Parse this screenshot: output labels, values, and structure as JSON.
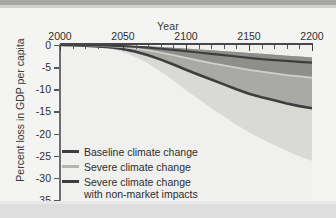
{
  "figure": {
    "title_x": "Year",
    "title_y": "Percent loss in GDP per capita"
  },
  "axes": {
    "x_ticks_major": [
      "2000",
      "2050",
      "2100",
      "2150",
      "2200"
    ],
    "y_ticks": [
      "0",
      "-5",
      "-10",
      "-15",
      "-20",
      "-25",
      "-30",
      "-35"
    ]
  },
  "legend": {
    "items": [
      {
        "label": "Baseline climate change",
        "color": "#3c3e40"
      },
      {
        "label": "Severe climate change",
        "color": "#b4b4b2"
      },
      {
        "label": "Severe climate change",
        "color": "#3c3e40"
      }
    ],
    "continuation": "with non-market impacts"
  },
  "colors": {
    "plot_background": "#f0f0ee",
    "page_background": "#f3f3f1",
    "band_outer_light": "#d9d9d6",
    "band_mid_gray": "#a9a9a6",
    "band_inner_dark": "#8e8e8b",
    "line_dark": "#3c3e40",
    "line_light": "#cfcfcb",
    "axis": "#45474a",
    "text": "#2f2f2f"
  },
  "chart_data": {
    "type": "area",
    "title": "",
    "xlabel": "Year",
    "ylabel": "Percent loss in GDP per capita",
    "xlim": [
      2000,
      2200
    ],
    "ylim": [
      -35,
      0
    ],
    "x_tick_step_minor": 10,
    "x_tick_step_major": 50,
    "y_tick_step": 5,
    "grid": false,
    "legend_position": "lower-left inside plot",
    "x": [
      2000,
      2010,
      2020,
      2030,
      2040,
      2050,
      2060,
      2070,
      2080,
      2090,
      2100,
      2110,
      2120,
      2130,
      2140,
      2150,
      2160,
      2170,
      2180,
      2190,
      2200
    ],
    "series": [
      {
        "name": "Baseline climate change",
        "role": "mean-line",
        "color": "#3c3e40",
        "values": [
          0,
          0,
          -0.05,
          -0.1,
          -0.15,
          -0.25,
          -0.4,
          -0.6,
          -0.85,
          -1.1,
          -1.4,
          -1.7,
          -2.0,
          -2.3,
          -2.6,
          -2.9,
          -3.2,
          -3.4,
          -3.6,
          -3.8,
          -4.0
        ]
      },
      {
        "name": "Baseline climate change (5th-95th percentile band)",
        "role": "band",
        "color": "#a9a9a6",
        "lower": [
          0,
          -0.05,
          -0.1,
          -0.2,
          -0.3,
          -0.45,
          -0.7,
          -1.0,
          -1.4,
          -1.9,
          -2.4,
          -2.9,
          -3.4,
          -3.9,
          -4.4,
          -4.9,
          -5.2,
          -5.5,
          -5.8,
          -6.0,
          -6.2
        ],
        "upper": [
          0,
          0,
          0,
          -0.05,
          -0.1,
          -0.15,
          -0.2,
          -0.3,
          -0.45,
          -0.6,
          -0.8,
          -1.0,
          -1.2,
          -1.4,
          -1.6,
          -1.8,
          -2.0,
          -2.2,
          -2.4,
          -2.6,
          -2.8
        ]
      },
      {
        "name": "Severe climate change",
        "role": "mean-line",
        "color": "#cfcfcb",
        "values": [
          0,
          0,
          -0.1,
          -0.2,
          -0.3,
          -0.5,
          -0.8,
          -1.2,
          -1.7,
          -2.3,
          -2.9,
          -3.5,
          -4.1,
          -4.6,
          -5.1,
          -5.6,
          -6.0,
          -6.4,
          -6.8,
          -7.1,
          -7.4
        ]
      },
      {
        "name": "Severe climate change with non-market impacts",
        "role": "mean-line",
        "color": "#3c3e40",
        "values": [
          0,
          -0.05,
          -0.15,
          -0.3,
          -0.5,
          -0.9,
          -1.5,
          -2.3,
          -3.3,
          -4.4,
          -5.6,
          -6.7,
          -7.8,
          -8.9,
          -10.0,
          -11.0,
          -11.8,
          -12.5,
          -13.2,
          -13.8,
          -14.3
        ]
      },
      {
        "name": "Severe climate change with non-market impacts (uncertainty band)",
        "role": "band",
        "color": "#d9d9d6",
        "lower": [
          0,
          -0.1,
          -0.25,
          -0.5,
          -0.9,
          -1.6,
          -2.7,
          -4.2,
          -6.0,
          -8.0,
          -10.2,
          -12.2,
          -14.2,
          -16.1,
          -18.0,
          -19.7,
          -21.2,
          -22.6,
          -23.9,
          -25.1,
          -26.2
        ],
        "upper": [
          0,
          0,
          -0.05,
          -0.1,
          -0.2,
          -0.35,
          -0.55,
          -0.85,
          -1.2,
          -1.6,
          -2.0,
          -2.4,
          -2.8,
          -3.1,
          -3.4,
          -3.7,
          -3.9,
          -4.1,
          -4.3,
          -4.5,
          -4.7
        ]
      }
    ],
    "annotations": [
      "All curves start at 0% loss in 2000 and diverge after roughly 2050.",
      "By 2200 the baseline mean loss is about -4%, severe climate change about -7.4%, and severe climate change with non-market impacts about -14.3%."
    ]
  }
}
